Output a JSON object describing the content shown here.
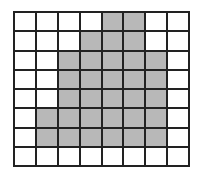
{
  "grid": {
    "rows": 8,
    "cols": 8,
    "line_color": "#222222",
    "fill_color": "#b8b8b8",
    "empty_color": "#ffffff",
    "shaded": [
      [
        0,
        0,
        0,
        0,
        1,
        1,
        0,
        0
      ],
      [
        0,
        0,
        0,
        1,
        1,
        1,
        0,
        0
      ],
      [
        0,
        0,
        1,
        1,
        1,
        1,
        1,
        0
      ],
      [
        0,
        0,
        1,
        1,
        1,
        1,
        1,
        0
      ],
      [
        0,
        0,
        1,
        1,
        1,
        1,
        1,
        0
      ],
      [
        0,
        1,
        1,
        1,
        1,
        1,
        1,
        0
      ],
      [
        0,
        1,
        1,
        1,
        1,
        1,
        1,
        0
      ],
      [
        0,
        0,
        0,
        0,
        0,
        0,
        0,
        0
      ]
    ]
  }
}
